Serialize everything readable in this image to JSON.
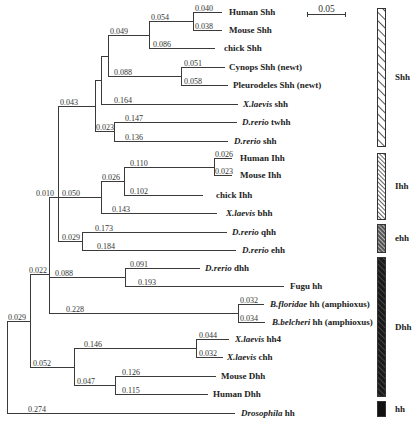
{
  "scale_bar": {
    "label": "0.05",
    "x1": 307,
    "x2": 346,
    "y": 14
  },
  "groups": [
    {
      "id": "shh",
      "label": "Shh",
      "y1": 8,
      "y2": 146,
      "pattern": "hatch-light"
    },
    {
      "id": "ihh",
      "label": "Ihh",
      "y1": 153,
      "y2": 219,
      "pattern": "hatch-dense"
    },
    {
      "id": "ehh",
      "label": "ehh",
      "y1": 224,
      "y2": 252,
      "pattern": "hatch-dark"
    },
    {
      "id": "dhh",
      "label": "Dhh",
      "y1": 257,
      "y2": 396,
      "pattern": "hatch-black"
    },
    {
      "id": "hh",
      "label": "hh",
      "y1": 401,
      "y2": 416,
      "pattern": "solid"
    }
  ],
  "leaves": [
    {
      "id": "human-shh",
      "y": 12,
      "x": 222,
      "text_x": 229,
      "ital": "",
      "rest": "Human Shh"
    },
    {
      "id": "mouse-shh",
      "y": 30,
      "x": 222,
      "text_x": 229,
      "ital": "",
      "rest": "Mouse Shh"
    },
    {
      "id": "chick-shh",
      "y": 48,
      "x": 215,
      "text_x": 224,
      "ital": "",
      "rest": "chick Shh"
    },
    {
      "id": "cynops-shh",
      "y": 67,
      "x": 225,
      "text_x": 229,
      "ital": "",
      "rest": "Cynops Shh (newt)"
    },
    {
      "id": "pleuro-shh",
      "y": 85,
      "x": 228,
      "text_x": 233,
      "ital": "",
      "rest": "Pleurodeles Shh (newt)"
    },
    {
      "id": "xlaevis-shh",
      "y": 104,
      "x": 238,
      "text_x": 243,
      "ital": "X.laevis",
      "rest": " shh"
    },
    {
      "id": "drerio-twhh",
      "y": 122,
      "x": 237,
      "text_x": 242,
      "ital": "D.rerio",
      "rest": " twhh"
    },
    {
      "id": "drerio-shh",
      "y": 141,
      "x": 228,
      "text_x": 234,
      "ital": "D.rerio",
      "rest": " shh"
    },
    {
      "id": "human-ihh",
      "y": 158,
      "x": 232,
      "text_x": 240,
      "ital": "",
      "rest": "Human Ihh"
    },
    {
      "id": "mouse-ihh",
      "y": 175,
      "x": 232,
      "text_x": 240,
      "ital": "",
      "rest": "Mouse Ihh"
    },
    {
      "id": "chick-ihh",
      "y": 195,
      "x": 203,
      "text_x": 216,
      "ital": "",
      "rest": "chick Ihh"
    },
    {
      "id": "xlaevis-bhh",
      "y": 213,
      "x": 217,
      "text_x": 226,
      "ital": "X.laevis",
      "rest": " bhh"
    },
    {
      "id": "drerio-qhh",
      "y": 232,
      "x": 227,
      "text_x": 232,
      "ital": "D.rerio",
      "rest": " qhh"
    },
    {
      "id": "drerio-ehh",
      "y": 250,
      "x": 236,
      "text_x": 242,
      "ital": "D.rerio",
      "rest": " ehh"
    },
    {
      "id": "drerio-dhh",
      "y": 268,
      "x": 200,
      "text_x": 205,
      "ital": "D.rerio",
      "rest": " dhh"
    },
    {
      "id": "fugu-hh",
      "y": 286,
      "x": 284,
      "text_x": 290,
      "ital": "",
      "rest": "Fugu hh"
    },
    {
      "id": "bfloridae-hh",
      "y": 304,
      "x": 264,
      "text_x": 270,
      "ital": "B.floridae",
      "rest": " hh (amphioxus)"
    },
    {
      "id": "bbelcheri-hh",
      "y": 322,
      "x": 265,
      "text_x": 272,
      "ital": "B.belcheri",
      "rest": " hh (amphioxus)"
    },
    {
      "id": "xlaevis-hh4",
      "y": 339,
      "x": 229,
      "text_x": 235,
      "ital": "X.laevis",
      "rest": " hh4"
    },
    {
      "id": "xlaevis-chh",
      "y": 357,
      "x": 223,
      "text_x": 227,
      "ital": "X.laevis",
      "rest": " chh"
    },
    {
      "id": "mouse-dhh",
      "y": 376,
      "x": 216,
      "text_x": 221,
      "ital": "",
      "rest": "Mouse Dhh"
    },
    {
      "id": "human-dhh",
      "y": 394,
      "x": 208,
      "text_x": 213,
      "ital": "",
      "rest": "Human Dhh"
    },
    {
      "id": "drosophila-hh",
      "y": 413,
      "x": 235,
      "text_x": 241,
      "ital": "Drosophila",
      "rest": " hh"
    }
  ],
  "branches": [
    {
      "x1": 193,
      "x2": 222,
      "y": 12,
      "label": "0.040",
      "lx": 195
    },
    {
      "x1": 193,
      "x2": 222,
      "y": 30,
      "label": "0.038",
      "lx": 195
    },
    {
      "x1": 149,
      "x2": 193,
      "y": 21,
      "label": "0.054",
      "lx": 151
    },
    {
      "x1": 149,
      "x2": 215,
      "y": 48,
      "label": "0.086",
      "lx": 153
    },
    {
      "x1": 108,
      "x2": 149,
      "y": 35,
      "label": "0.049",
      "lx": 110
    },
    {
      "x1": 181,
      "x2": 225,
      "y": 67,
      "label": "0.051",
      "lx": 184
    },
    {
      "x1": 181,
      "x2": 228,
      "y": 85,
      "label": "0.058",
      "lx": 184
    },
    {
      "x1": 108,
      "x2": 181,
      "y": 76,
      "label": "0.088",
      "lx": 114
    },
    {
      "x1": 101,
      "x2": 108,
      "y": 56,
      "label": "",
      "lx": 0
    },
    {
      "x1": 101,
      "x2": 238,
      "y": 104,
      "label": "0.164",
      "lx": 114
    },
    {
      "x1": 95,
      "x2": 101,
      "y": 80,
      "label": "",
      "lx": 0
    },
    {
      "x1": 114,
      "x2": 237,
      "y": 122,
      "label": "0.147",
      "lx": 125
    },
    {
      "x1": 114,
      "x2": 228,
      "y": 141,
      "label": "0.136",
      "lx": 125
    },
    {
      "x1": 95,
      "x2": 114,
      "y": 131,
      "label": "0.023",
      "lx": 96
    },
    {
      "x1": 58,
      "x2": 95,
      "y": 106,
      "label": "0.043",
      "lx": 60
    },
    {
      "x1": 214,
      "x2": 232,
      "y": 158,
      "label": "0.026",
      "lx": 215
    },
    {
      "x1": 214,
      "x2": 232,
      "y": 175,
      "label": "0.023",
      "lx": 215
    },
    {
      "x1": 124,
      "x2": 214,
      "y": 167,
      "label": "0.110",
      "lx": 130
    },
    {
      "x1": 124,
      "x2": 203,
      "y": 195,
      "label": "0.102",
      "lx": 130
    },
    {
      "x1": 101,
      "x2": 124,
      "y": 181,
      "label": "0.026",
      "lx": 102
    },
    {
      "x1": 101,
      "x2": 217,
      "y": 213,
      "label": "0.143",
      "lx": 112
    },
    {
      "x1": 58,
      "x2": 101,
      "y": 197,
      "label": "0.050",
      "lx": 62
    },
    {
      "x1": 82,
      "x2": 227,
      "y": 232,
      "label": "0.173",
      "lx": 95
    },
    {
      "x1": 82,
      "x2": 236,
      "y": 250,
      "label": "0.184",
      "lx": 97
    },
    {
      "x1": 58,
      "x2": 82,
      "y": 241,
      "label": "0.029",
      "lx": 62
    },
    {
      "x1": 49,
      "x2": 58,
      "y": 197,
      "label": "0.010",
      "lx": 36
    },
    {
      "x1": 125,
      "x2": 200,
      "y": 268,
      "label": "0.091",
      "lx": 130
    },
    {
      "x1": 125,
      "x2": 284,
      "y": 286,
      "label": "0.193",
      "lx": 138
    },
    {
      "x1": 49,
      "x2": 125,
      "y": 277,
      "label": "0.088",
      "lx": 55
    },
    {
      "x1": 238,
      "x2": 264,
      "y": 304,
      "label": "0.032",
      "lx": 240
    },
    {
      "x1": 238,
      "x2": 265,
      "y": 322,
      "label": "0.034",
      "lx": 240
    },
    {
      "x1": 49,
      "x2": 238,
      "y": 313,
      "label": "0.228",
      "lx": 66
    },
    {
      "x1": 30,
      "x2": 49,
      "y": 274,
      "label": "0.022",
      "lx": 29
    },
    {
      "x1": 196,
      "x2": 229,
      "y": 339,
      "label": "0.044",
      "lx": 199
    },
    {
      "x1": 196,
      "x2": 223,
      "y": 357,
      "label": "0.032",
      "lx": 199
    },
    {
      "x1": 74,
      "x2": 196,
      "y": 348,
      "label": "0.146",
      "lx": 84
    },
    {
      "x1": 115,
      "x2": 216,
      "y": 376,
      "label": "0.126",
      "lx": 122
    },
    {
      "x1": 115,
      "x2": 208,
      "y": 394,
      "label": "0.115",
      "lx": 122
    },
    {
      "x1": 74,
      "x2": 115,
      "y": 385,
      "label": "0.047",
      "lx": 77
    },
    {
      "x1": 30,
      "x2": 74,
      "y": 367,
      "label": "0.052",
      "lx": 33
    },
    {
      "x1": 7,
      "x2": 30,
      "y": 321,
      "label": "0.029",
      "lx": 8
    },
    {
      "x1": 7,
      "x2": 235,
      "y": 413,
      "label": "0.274",
      "lx": 28
    }
  ],
  "verticals": [
    {
      "x": 193,
      "y1": 12,
      "y2": 30
    },
    {
      "x": 149,
      "y1": 21,
      "y2": 48
    },
    {
      "x": 181,
      "y1": 67,
      "y2": 85
    },
    {
      "x": 108,
      "y1": 35,
      "y2": 76
    },
    {
      "x": 101,
      "y1": 56,
      "y2": 104
    },
    {
      "x": 114,
      "y1": 122,
      "y2": 141
    },
    {
      "x": 95,
      "y1": 80,
      "y2": 131
    },
    {
      "x": 214,
      "y1": 158,
      "y2": 175
    },
    {
      "x": 124,
      "y1": 167,
      "y2": 195
    },
    {
      "x": 101,
      "y1": 181,
      "y2": 213
    },
    {
      "x": 82,
      "y1": 232,
      "y2": 250
    },
    {
      "x": 58,
      "y1": 106,
      "y2": 241
    },
    {
      "x": 125,
      "y1": 268,
      "y2": 286
    },
    {
      "x": 238,
      "y1": 304,
      "y2": 322
    },
    {
      "x": 49,
      "y1": 197,
      "y2": 313
    },
    {
      "x": 196,
      "y1": 339,
      "y2": 357
    },
    {
      "x": 115,
      "y1": 376,
      "y2": 394
    },
    {
      "x": 74,
      "y1": 348,
      "y2": 385
    },
    {
      "x": 30,
      "y1": 274,
      "y2": 367
    },
    {
      "x": 7,
      "y1": 321,
      "y2": 413
    }
  ]
}
